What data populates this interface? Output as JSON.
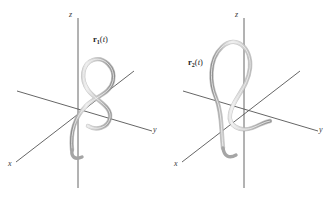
{
  "figure": {
    "background_color": "#ffffff",
    "axis_color": "#555555",
    "curve_color": "#9d9d9d",
    "curve_highlight_color": "#e8e8e8",
    "label_color": "#1c1c1c"
  },
  "panels": [
    {
      "id": "left",
      "axes": {
        "x_label": "x",
        "y_label": "y",
        "z_label": "z"
      },
      "curve": {
        "label_vector": "r",
        "label_subscript": "1",
        "label_argument": "(t)",
        "label_open": "(",
        "label_var": "t",
        "label_close": ")",
        "orientation": "right-of-z-axis",
        "shape": "helix"
      }
    },
    {
      "id": "right",
      "axes": {
        "x_label": "x",
        "y_label": "y",
        "z_label": "z"
      },
      "curve": {
        "label_vector": "r",
        "label_subscript": "2",
        "label_argument": "(t)",
        "label_open": "(",
        "label_var": "t",
        "label_close": ")",
        "orientation": "left-of-z-axis",
        "shape": "helix"
      }
    }
  ]
}
